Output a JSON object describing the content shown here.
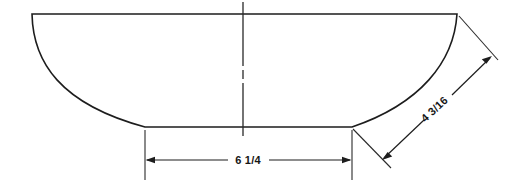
{
  "drawing": {
    "title": "Bowl cross-section elevation drawing",
    "background_color": "#ffffff",
    "line_color": "#1d1d1d",
    "dimension_color": "#1d1d1d",
    "part": {
      "name": "bowl-profile",
      "description": "Symmetric bowl / vessel cross-section with flat rim, curved sidewalls and flat base",
      "top_rim_left_x": 32,
      "top_rim_right_x": 457,
      "top_rim_y": 14,
      "base_left_x": 145,
      "base_right_x": 352,
      "base_y": 127
    },
    "centerline": {
      "name": "vertical-centerline",
      "x": 243,
      "top_y": 2,
      "bottom_y": 136,
      "style": "dash-dot"
    },
    "dimensions": [
      {
        "id": "base-width",
        "label": "6 1/4",
        "orientation": "horizontal",
        "value": "6 1/4",
        "whole": "6",
        "fraction": "1/4",
        "units": "inches",
        "measures": "base width",
        "line_y": 160,
        "start_x": 145,
        "end_x": 352,
        "text_x": 248,
        "text_y": 164
      },
      {
        "id": "sidewall-chord",
        "label": "4 3/16",
        "orientation": "diagonal",
        "value": "4 3/16",
        "whole": "4",
        "fraction": "3/16",
        "units": "inches",
        "measures": "right sidewall chord from rim to base",
        "angle_degrees": -43,
        "start_x": 383,
        "start_y": 159,
        "end_x": 491,
        "end_y": 57,
        "text_x": 437,
        "text_y": 112
      }
    ]
  }
}
